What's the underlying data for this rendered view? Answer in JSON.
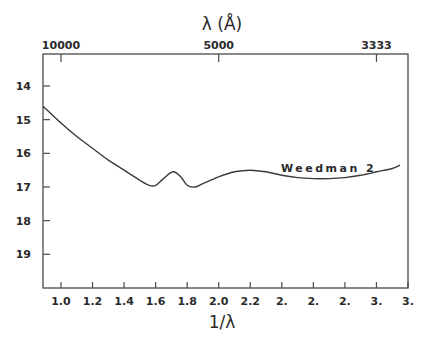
{
  "chart_data": {
    "type": "line",
    "title": "",
    "xlabel": "1/λ",
    "ylabel": "",
    "top_xlabel": "λ (Å)",
    "xlim": [
      0.886,
      3.2
    ],
    "ylim": [
      20.0,
      13.05
    ],
    "y_inverted": true,
    "grid": false,
    "legend": "none",
    "x_ticks": [
      1.0,
      1.2,
      1.4,
      1.6,
      1.8,
      2.0,
      2.2,
      2.4,
      2.6,
      2.8,
      3.0,
      3.2
    ],
    "x_tick_labels": [
      "1.0",
      "1.2",
      "1.4",
      "1.6",
      "1.8",
      "2.0",
      "2.2",
      "2.",
      "2.",
      "2.",
      "3.",
      "3."
    ],
    "y_ticks": [
      14,
      15,
      16,
      17,
      18,
      19
    ],
    "y_tick_labels": [
      "14",
      "15",
      "16",
      "17",
      "18",
      "19"
    ],
    "top_ticks": [
      {
        "x": 1.0,
        "label": "10000"
      },
      {
        "x": 2.0,
        "label": "5000"
      },
      {
        "x": 3.0,
        "label": "3333"
      }
    ],
    "series": [
      {
        "name": "Weedman 2",
        "x": [
          0.886,
          1.0,
          1.1,
          1.2,
          1.3,
          1.4,
          1.5,
          1.56,
          1.6,
          1.65,
          1.71,
          1.76,
          1.8,
          1.85,
          1.9,
          2.0,
          2.1,
          2.2,
          2.3,
          2.4,
          2.5,
          2.6,
          2.7,
          2.8,
          2.9,
          3.0,
          3.1,
          3.15
        ],
        "values": [
          14.6,
          15.1,
          15.5,
          15.85,
          16.2,
          16.5,
          16.8,
          16.95,
          16.95,
          16.75,
          16.55,
          16.7,
          16.95,
          17.0,
          16.9,
          16.7,
          16.55,
          16.5,
          16.55,
          16.65,
          16.72,
          16.75,
          16.75,
          16.72,
          16.65,
          16.55,
          16.45,
          16.35
        ]
      }
    ],
    "annotations": [
      {
        "text": "Weedman 2",
        "x": 2.3,
        "y": 16.55
      }
    ]
  },
  "frame": {
    "left": 43,
    "right": 408,
    "top": 54,
    "bottom": 288
  },
  "colors": {
    "line": "#3a3a3a",
    "axis": "#4a4a4a",
    "background": "#ffffff"
  }
}
